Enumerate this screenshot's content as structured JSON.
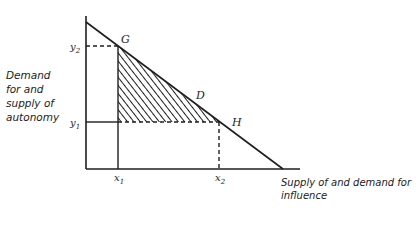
{
  "diagram": {
    "y_axis_label_lines": [
      "Demand",
      "for and",
      "supply of",
      "autonomy"
    ],
    "x_axis_label_lines": [
      "Supply of and demand for",
      "influence"
    ],
    "points": {
      "G": "G",
      "D": "D",
      "H": "H"
    },
    "ticks": {
      "y2": "y",
      "y2_sub": "2",
      "y1": "y",
      "y1_sub": "1",
      "x1": "x",
      "x1_sub": "1",
      "x2": "x",
      "x2_sub": "2"
    },
    "colors": {
      "ink": "#1e1e1e",
      "background": "#ffffff"
    }
  }
}
